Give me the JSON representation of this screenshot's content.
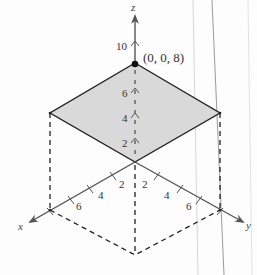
{
  "figure": {
    "type": "3d-plane-sketch",
    "axes": {
      "x": {
        "label": "x",
        "ticks": [
          "2",
          "4",
          "6"
        ]
      },
      "y": {
        "label": "y",
        "ticks": [
          "2",
          "4",
          "6"
        ]
      },
      "z": {
        "label": "z",
        "ticks": [
          "2",
          "4",
          "6",
          "10"
        ]
      }
    },
    "point_label": "(0, 0, 8)",
    "colors": {
      "plane_fill": "#d9d9d9",
      "plane_edge": "#222222",
      "axis": "#555555",
      "dashed": "#222222"
    }
  }
}
